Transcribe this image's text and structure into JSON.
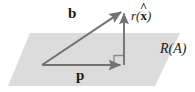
{
  "figure": {
    "background_color": "#ffffff",
    "plane": {
      "name": "range-of-A-plane",
      "label": "R(A)",
      "fill_color": "#dcdcdc",
      "points": "30,33 180,33 155,86 8,86"
    },
    "vectors": [
      {
        "key": "b",
        "label": "b",
        "style": "bold-upright",
        "color": "#737373",
        "from": [
          42,
          65
        ],
        "to": [
          124,
          10
        ]
      },
      {
        "key": "p",
        "label": "p",
        "style": "bold-upright",
        "color": "#737373",
        "from": [
          42,
          65
        ],
        "to": [
          124,
          65
        ]
      },
      {
        "key": "r",
        "label_parts": {
          "fn": "r",
          "open": "(",
          "var": "x",
          "accent": "^",
          "close": ")"
        },
        "label": "r(x̂)",
        "style": "italic-with-bold-hat-vector",
        "color": "#737373",
        "from": [
          124,
          65
        ],
        "to": [
          124,
          10
        ]
      }
    ],
    "right_angle_marker": {
      "name": "right-angle-marker",
      "color": "#737373",
      "corner": [
        124,
        65
      ],
      "size": 10
    },
    "plane_label": {
      "name": "plane-label",
      "text": "R(A)",
      "position": [
        160,
        42
      ]
    }
  }
}
